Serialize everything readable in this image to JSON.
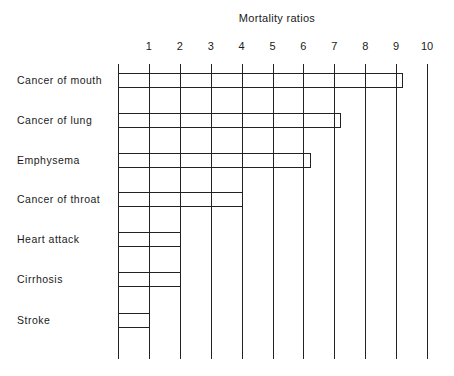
{
  "chart_data": {
    "type": "bar",
    "orientation": "horizontal",
    "title": "Mortality ratios",
    "xlabel": "Mortality ratios",
    "ylabel": "",
    "xlim": [
      0,
      10
    ],
    "x_ticks": [
      "1",
      "2",
      "3",
      "4",
      "5",
      "6",
      "7",
      "8",
      "9",
      "10"
    ],
    "grid": true,
    "legend": null,
    "categories": [
      "Cancer of mouth",
      "Cancer of lung",
      "Emphysema",
      "Cancer of throat",
      "Heart attack",
      "Cirrhosis",
      "Stroke"
    ],
    "values": [
      9.2,
      7.2,
      6.2,
      4,
      2,
      2,
      1
    ]
  },
  "layout": {
    "origin_x": 118,
    "unit_px": 30.9,
    "bar_tops": [
      73,
      113,
      153,
      192,
      232,
      272,
      313
    ],
    "line_color": "#222222"
  }
}
